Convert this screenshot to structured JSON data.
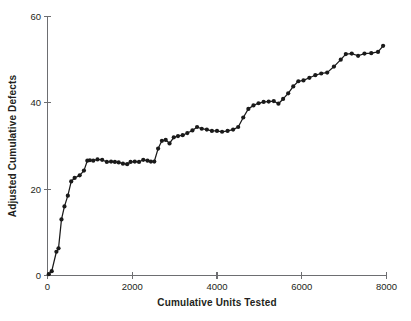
{
  "chart_data": {
    "type": "line",
    "title": "",
    "xlabel": "Cumulative Units Tested",
    "ylabel": "Adjusted Cumulative Defects",
    "xlim": [
      0,
      8000
    ],
    "ylim": [
      0,
      60
    ],
    "xticks": [
      0,
      2000,
      4000,
      6000,
      8000
    ],
    "xticklabels": [
      "0",
      "2000",
      "4000",
      "6000",
      "8000"
    ],
    "yticks": [
      0,
      20,
      40,
      60
    ],
    "yticklabels": [
      "0",
      "20",
      "40",
      "60"
    ],
    "grid": false,
    "legend": null,
    "marker": "filled-circle",
    "series": [
      {
        "name": "Adjusted Cumulative Defects",
        "x": [
          30,
          100,
          210,
          260,
          330,
          400,
          480,
          560,
          640,
          760,
          860,
          940,
          1000,
          1080,
          1180,
          1290,
          1400,
          1500,
          1590,
          1680,
          1780,
          1880,
          1960,
          2060,
          2160,
          2260,
          2360,
          2440,
          2520,
          2610,
          2700,
          2790,
          2880,
          2980,
          3080,
          3190,
          3300,
          3420,
          3530,
          3640,
          3760,
          3880,
          4000,
          4120,
          4250,
          4380,
          4500,
          4620,
          4740,
          4860,
          4980,
          5100,
          5220,
          5340,
          5450,
          5560,
          5680,
          5800,
          5920,
          6040,
          6180,
          6320,
          6460,
          6600,
          6760,
          6920,
          7040,
          7180,
          7330,
          7480,
          7640,
          7800,
          7920
        ],
        "y": [
          0.3,
          1.0,
          5.5,
          6.3,
          13.0,
          16.0,
          18.5,
          21.8,
          22.6,
          23.2,
          24.3,
          26.6,
          26.7,
          26.6,
          26.9,
          26.8,
          26.3,
          26.4,
          26.3,
          26.2,
          25.9,
          25.8,
          26.3,
          26.4,
          26.3,
          26.8,
          26.6,
          26.4,
          26.4,
          29.4,
          31.2,
          31.4,
          30.6,
          32.0,
          32.3,
          32.5,
          33.0,
          33.6,
          34.4,
          34.0,
          33.8,
          33.5,
          33.5,
          33.3,
          33.5,
          33.8,
          34.4,
          36.6,
          38.6,
          39.4,
          39.9,
          40.2,
          40.3,
          40.4,
          39.8,
          40.9,
          42.2,
          43.8,
          45.0,
          45.2,
          45.8,
          46.4,
          46.8,
          47.0,
          48.4,
          50.0,
          51.3,
          51.4,
          50.9,
          51.4,
          51.5,
          51.8,
          53.2
        ]
      }
    ]
  },
  "axes": {
    "y_axis_name": "y-axis",
    "x_axis_name": "x-axis"
  }
}
